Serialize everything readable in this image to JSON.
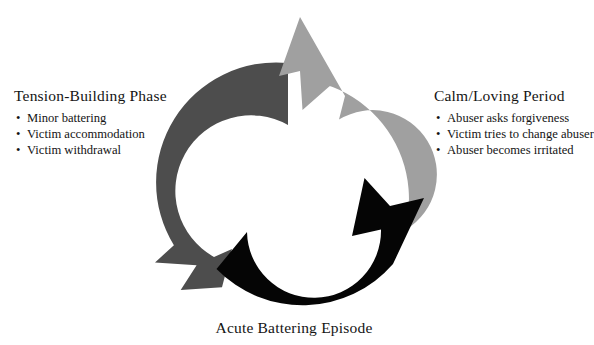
{
  "diagram": {
    "type": "cycle",
    "center": {
      "x": 288,
      "y": 183
    },
    "outer_radius": 120,
    "inner_radius": 62,
    "colors": {
      "tension_building": "#4d4d4d",
      "calm_loving": "#a0a0a0",
      "acute_battering": "#050505",
      "background": "#ffffff",
      "text": "#141414"
    },
    "segments": [
      {
        "id": "tension-building",
        "color": "#4d4d4d",
        "start_angle_deg": 270,
        "end_angle_deg": 130,
        "arrow_direction": "clockwise"
      },
      {
        "id": "calm-loving",
        "color": "#a0a0a0",
        "start_angle_deg": 275,
        "end_angle_deg": 30,
        "arrow_direction": "clockwise"
      },
      {
        "id": "acute-battering",
        "color": "#050505",
        "start_angle_deg": 140,
        "end_angle_deg": 355,
        "arrow_direction": "clockwise"
      }
    ]
  },
  "phases": {
    "tension_building": {
      "title": "Tension-Building Phase",
      "bullet": "•",
      "items": [
        "Minor battering",
        "Victim accommodation",
        "Victim withdrawal"
      ]
    },
    "calm_loving": {
      "title": "Calm/Loving Period",
      "bullet": "•",
      "items": [
        "Abuser asks forgiveness",
        "Victim tries to change abuser",
        "Abuser becomes irritated"
      ]
    },
    "acute_battering": {
      "title": "Acute Battering Episode"
    }
  }
}
